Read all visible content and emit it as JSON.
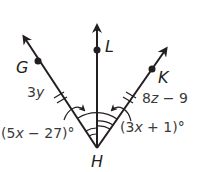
{
  "diagram": {
    "colors": {
      "ink": "#231f20",
      "text": "#3a3a3a",
      "background": "#ffffff"
    },
    "vertex": {
      "label": "H"
    },
    "points": [
      {
        "label": "G"
      },
      {
        "label": "L"
      },
      {
        "label": "K"
      }
    ],
    "segment_labels": {
      "GH": {
        "coef": "3",
        "var": "y"
      },
      "HK": {
        "coef": "8",
        "var": "z",
        "rest": " − 9"
      }
    },
    "angle_labels": {
      "GHL": {
        "open": "(5",
        "var": "x",
        "rest": " − 27)°"
      },
      "LHK": {
        "open": "(3",
        "var": "x",
        "rest": " + 1)°"
      }
    }
  }
}
